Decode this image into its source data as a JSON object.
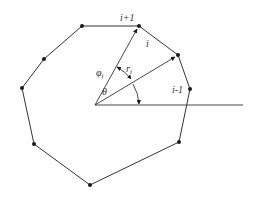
{
  "diagram": {
    "type": "polygon-polar-geometry",
    "colors": {
      "stroke": "#333333",
      "vertex": "#1a1a1a",
      "background": "#ffffff"
    },
    "origin": {
      "x": 95,
      "y": 105
    },
    "axis": {
      "x1": 95,
      "y1": 105,
      "x2": 243,
      "y2": 105
    },
    "vertices": [
      {
        "id": "v_ip1",
        "x": 139,
        "y": 26
      },
      {
        "id": "v_i",
        "x": 178,
        "y": 55
      },
      {
        "id": "v_im1",
        "x": 190,
        "y": 89
      },
      {
        "id": "v4",
        "x": 179,
        "y": 142
      },
      {
        "id": "v5",
        "x": 90,
        "y": 185
      },
      {
        "id": "v6",
        "x": 34,
        "y": 144
      },
      {
        "id": "v7",
        "x": 22,
        "y": 88
      },
      {
        "id": "v8",
        "x": 44,
        "y": 59
      },
      {
        "id": "v9",
        "x": 82,
        "y": 26
      }
    ],
    "labels": {
      "i_plus_1": "i+1",
      "i": "i",
      "i_minus_1": "i-1",
      "theta": "θ",
      "phi": "φ",
      "phi_sub": "i",
      "r": "r",
      "r_sub": "i"
    }
  }
}
